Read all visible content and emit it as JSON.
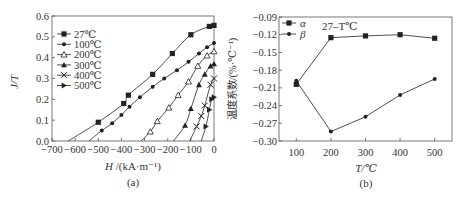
{
  "chart_data": [
    {
      "panel_label": "(a)",
      "type": "line",
      "title": "",
      "xlabel": "H /(kA·m⁻¹)",
      "ylabel": "J/T",
      "xlim": [
        -700,
        0
      ],
      "ylim": [
        0.0,
        0.6
      ],
      "x_ticks": [
        "−700",
        "−600",
        "−500",
        "−400",
        "−300",
        "−200",
        "−100",
        "0"
      ],
      "y_ticks": [
        "0.0",
        "0.1",
        "0.2",
        "0.3",
        "0.4",
        "0.5",
        "0.6"
      ],
      "grid": false,
      "legend_position": "upper-left",
      "series": [
        {
          "name": "27℃",
          "marker": "square",
          "x": [
            -630,
            -500,
            -390,
            -370,
            -265,
            -180,
            -100,
            -20,
            0
          ],
          "y": [
            0.0,
            0.09,
            0.18,
            0.22,
            0.32,
            0.42,
            0.51,
            0.55,
            0.555
          ]
        },
        {
          "name": "100℃",
          "marker": "circle",
          "x": [
            -540,
            -485,
            -440,
            -400,
            -365,
            -320,
            -265,
            -215,
            -160,
            -110,
            -65,
            -30,
            0
          ],
          "y": [
            0.0,
            0.05,
            0.085,
            0.125,
            0.165,
            0.21,
            0.26,
            0.3,
            0.34,
            0.38,
            0.42,
            0.45,
            0.47
          ]
        },
        {
          "name": "200℃",
          "marker": "triangle-open",
          "x": [
            -315,
            -275,
            -245,
            -195,
            -155,
            -110,
            -70,
            -30,
            0
          ],
          "y": [
            0.0,
            0.045,
            0.095,
            0.16,
            0.22,
            0.285,
            0.36,
            0.41,
            0.43
          ]
        },
        {
          "name": "300℃",
          "marker": "triangle",
          "x": [
            -175,
            -125,
            -100,
            -65,
            -40,
            -15,
            0
          ],
          "y": [
            0.0,
            0.075,
            0.155,
            0.27,
            0.32,
            0.36,
            0.37
          ]
        },
        {
          "name": "400℃",
          "marker": "x",
          "x": [
            -105,
            -75,
            -55,
            -40,
            -15,
            0
          ],
          "y": [
            0.0,
            0.07,
            0.12,
            0.17,
            0.27,
            0.3
          ]
        },
        {
          "name": "500℃",
          "marker": "triangle-right",
          "x": [
            -55,
            -35,
            -20,
            -10,
            0
          ],
          "y": [
            0.0,
            0.07,
            0.15,
            0.2,
            0.21
          ]
        }
      ]
    },
    {
      "panel_label": "(b)",
      "type": "line",
      "title": "",
      "annotation": "27–T℃",
      "xlabel": "T/℃",
      "ylabel": "温度系数/(%·℃⁻¹)",
      "xlim": [
        50,
        550
      ],
      "ylim": [
        -0.3,
        -0.09
      ],
      "x_ticks": [
        "100",
        "200",
        "300",
        "400",
        "500"
      ],
      "y_ticks": [
        "−0.09",
        "−0.12",
        "−0.15",
        "−0.18",
        "−0.21",
        "−0.24",
        "−0.27",
        "−0.30"
      ],
      "grid": false,
      "legend_position": "upper-left",
      "categories": [
        100,
        200,
        300,
        400,
        500
      ],
      "series": [
        {
          "name": "α",
          "marker": "square",
          "values": [
            -0.204,
            -0.125,
            -0.122,
            -0.12,
            -0.126
          ]
        },
        {
          "name": "β",
          "marker": "circle",
          "values": [
            -0.198,
            -0.284,
            -0.259,
            -0.222,
            -0.195
          ]
        }
      ]
    }
  ],
  "labels": {
    "panel_a": "(a)",
    "panel_b": "(b)",
    "a_xlabel_italic": "H",
    "a_xlabel_rest": " /(kA·m⁻¹)",
    "a_ylabel": "J/T",
    "b_xlabel": "T/℃",
    "b_ylabel": "温度系数/(%·℃⁻¹)",
    "b_annotation": "27–T℃",
    "b_legend": [
      "α",
      "β"
    ],
    "a_legend": [
      "27℃",
      "100℃",
      "200℃",
      "300℃",
      "400℃",
      "500℃"
    ]
  }
}
